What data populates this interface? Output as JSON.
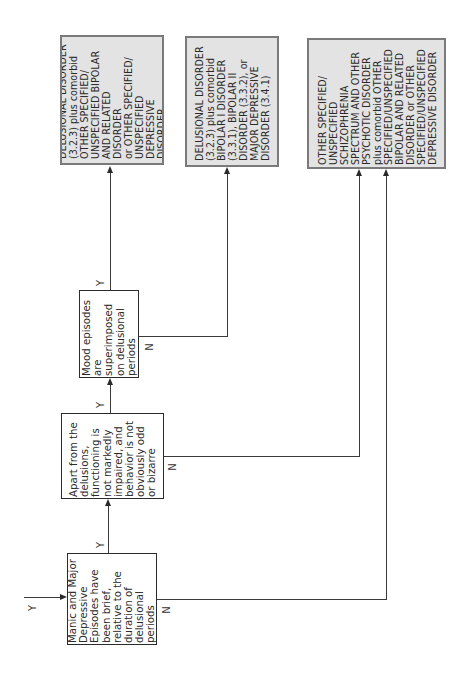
{
  "diagram": {
    "orientation": "rotated-90-ccw",
    "entry": {
      "label": "Y"
    },
    "decisions": [
      {
        "id": "brief_mood_episodes",
        "text": "Manic and Major\nDepressive\nEpisodes have\nbeen brief,\nrelative to the\nduration of\ndelusional periods",
        "yes_label": "Y",
        "no_label": "N"
      },
      {
        "id": "functioning_not_impaired",
        "text": "Apart from the\ndelusions,\nfunctioning is\nnot markedly\nimpaired, and\nbehavior is not\nobviously odd\nor bizarre",
        "yes_label": "Y",
        "no_label": "N"
      },
      {
        "id": "mood_superimposed",
        "text": "Mood episodes\nare superimposed\non delusional\nperiods",
        "yes_label": "Y",
        "no_label": "N"
      }
    ],
    "outcomes": [
      {
        "id": "outcome_1",
        "text": "DELUSIONAL DISORDER\n(3.2.3) plus comorbid\nOTHER SPECIFIED/\nUNSPECIFIED BIPOLAR\nAND RELATED DISORDER\nor OTHER SPECIFIED/\nUNSPECIFIED DEPRESSIVE\nDISORDER"
      },
      {
        "id": "outcome_2",
        "text": "DELUSIONAL DISORDER\n(3.2.3) plus comorbid\nBIPOLAR I DISORDER\n(3.3.1), BIPOLAR II\nDISORDER (3.3.2), or\nMAJOR DEPRESSIVE\nDISORDER (3.4.1)"
      },
      {
        "id": "outcome_3",
        "text": "OTHER SPECIFIED/\nUNSPECIFIED\nSCHIZOPHRENIA\nSPECTRUM AND OTHER\nPSYCHOTIC DISORDER\nplus comorbid OTHER\nSPECIFIED/UNSPECIFIED\nBIPOLAR AND RELATED\nDISORDER or OTHER\nSPECIFIED/UNSPECIFIED\nDEPRESSIVE DISORDER"
      }
    ],
    "colors": {
      "decision_fill": "#ffffff",
      "decision_border": "#2b2b2b",
      "outcome_fill": "#e3e3e3",
      "outcome_border": "#7a7a7a",
      "line": "#3a3a3a"
    }
  }
}
